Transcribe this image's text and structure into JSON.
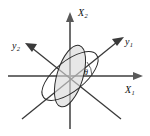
{
  "figure": {
    "background_color": "#ffffff",
    "width": 150,
    "height": 136,
    "origin": {
      "x": 70,
      "y": 76
    }
  },
  "axes": {
    "x1": {
      "name": "X1",
      "label_text": "X",
      "label_sub": "1",
      "color": "#6e6e6e",
      "start": {
        "x": 8,
        "y": 76
      },
      "end": {
        "x": 143,
        "y": 76
      },
      "arrow": "right"
    },
    "x2": {
      "name": "X2",
      "label_text": "X",
      "label_sub": "2",
      "color": "#6e6e6e",
      "start": {
        "x": 70,
        "y": 129
      },
      "end": {
        "x": 70,
        "y": 12
      },
      "arrow": "up"
    },
    "y1": {
      "name": "y1",
      "label_text": "y",
      "label_sub": "1",
      "color": "#3a3a3a",
      "start": {
        "x": 22,
        "y": 119
      },
      "end": {
        "x": 124,
        "y": 37
      },
      "arrow": "up-right"
    },
    "y2": {
      "name": "y2",
      "label_text": "y",
      "label_sub": "2",
      "color": "#3a3a3a",
      "start": {
        "x": 121,
        "y": 119
      },
      "end": {
        "x": 25,
        "y": 43
      },
      "arrow": "up-left"
    }
  },
  "angle": {
    "symbol": "θ",
    "description": "angle between X1 axis and y1 axis",
    "position": {
      "x": 84,
      "y": 69
    },
    "arc_radius": 22
  },
  "ellipses": [
    {
      "name": "steep-ellipse",
      "center": {
        "x": 70,
        "y": 76
      },
      "rx": 13,
      "ry": 32,
      "rotation_deg": 17,
      "fill": "#d9d9d9",
      "stroke": "#2b2b2b",
      "filled": true
    },
    {
      "name": "tilted-ellipse",
      "center": {
        "x": 70,
        "y": 76
      },
      "rx": 34,
      "ry": 15,
      "rotation_deg": -39,
      "fill": "none",
      "stroke": "#2b2b2b",
      "filled": false
    }
  ]
}
